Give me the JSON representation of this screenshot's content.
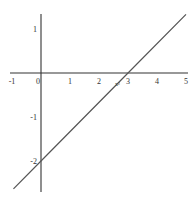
{
  "chart_data": {
    "type": "line",
    "title": "",
    "xlabel": "",
    "ylabel": "",
    "xlim": [
      -1,
      5
    ],
    "ylim": [
      -2.75,
      1.4
    ],
    "grid": false,
    "legend": null,
    "x_ticks": [
      {
        "value": -1,
        "label": "-1"
      },
      {
        "value": 0,
        "label": "0"
      },
      {
        "value": 1,
        "label": "1"
      },
      {
        "value": 2,
        "label": "2"
      },
      {
        "value": 3,
        "label": "3"
      },
      {
        "value": 4,
        "label": "4"
      },
      {
        "value": 5,
        "label": "5"
      }
    ],
    "y_ticks": [
      {
        "value": 1,
        "label": "1"
      },
      {
        "value": -1,
        "label": "-1"
      },
      {
        "value": -2,
        "label": "-2"
      }
    ],
    "series": [
      {
        "name": "y = (2/3)x - 2",
        "x": [
          -0.95,
          0,
          3,
          5
        ],
        "y": [
          -2.633,
          -2,
          0,
          1.333
        ],
        "color": "#555555"
      }
    ],
    "annotations": [
      {
        "text": "x²",
        "x": 2.55,
        "y": -0.3
      }
    ]
  },
  "colors": {
    "axis": "#333333",
    "line": "#555555",
    "background": "#ffffff"
  }
}
